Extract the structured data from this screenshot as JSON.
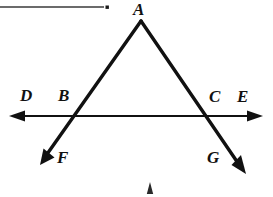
{
  "figure": {
    "kind": "geometry-diagram",
    "width": 273,
    "height": 197,
    "background_color": "#ffffff",
    "stroke_color": "#111111"
  },
  "labels": {
    "apex": "A",
    "left_outer": "D",
    "left_intersection": "B",
    "right_intersection": "C",
    "right_outer": "E",
    "left_ray_end": "F",
    "right_ray_end": "G"
  },
  "points": {
    "A": {
      "x": 141,
      "y": 21
    },
    "B": {
      "x": 76,
      "y": 116
    },
    "C": {
      "x": 204,
      "y": 116
    },
    "F": {
      "x": 40,
      "y": 164
    },
    "G": {
      "x": 245,
      "y": 173
    },
    "D_arrow_tip": {
      "x": 10,
      "y": 116
    },
    "E_arrow_tip": {
      "x": 262,
      "y": 116
    }
  },
  "segments": [
    {
      "name": "ray-A-to-F",
      "from": "A",
      "to": "F",
      "through": "B",
      "arrow_at": "F"
    },
    {
      "name": "ray-A-to-G",
      "from": "A",
      "to": "G",
      "through": "C",
      "arrow_at": "G"
    },
    {
      "name": "line-D-to-E",
      "from": "D_arrow_tip",
      "to": "E_arrow_tip",
      "arrow_at": "both"
    }
  ],
  "artifacts": {
    "top_rule": {
      "x1": 0,
      "y1": 7,
      "x2": 104,
      "y2": 7
    },
    "top_rule_dot": {
      "x": 107,
      "y": 7,
      "size": 3
    },
    "bottom_caret": {
      "x": 150,
      "y": 188
    }
  }
}
